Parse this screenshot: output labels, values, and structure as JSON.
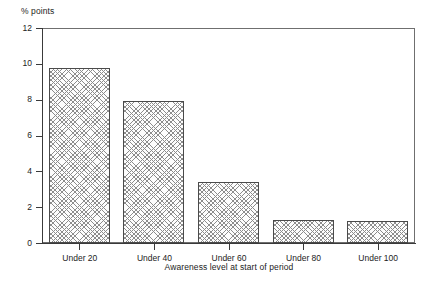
{
  "chart_data": {
    "type": "bar",
    "title": "",
    "subtitle": "",
    "categories": [
      "Under 20",
      "Under 40",
      "Under 60",
      "Under 80",
      "Under 100"
    ],
    "values": [
      9.75,
      7.95,
      3.4,
      1.28,
      1.22
    ],
    "series": [
      {
        "name": "% points",
        "values": [
          9.75,
          7.95,
          3.4,
          1.28,
          1.22
        ]
      }
    ],
    "xlabel": "Awareness level at start of period",
    "ylabel": "% points",
    "ylim": [
      0,
      12
    ],
    "yticks": [
      0,
      2,
      4,
      6,
      8,
      10,
      12
    ],
    "ytick_labels": [
      "0",
      "2",
      "4",
      "6",
      "8",
      "10",
      "12"
    ],
    "grid": false,
    "legend": false,
    "legend_position": "none",
    "bar_fill": "crosshatch-pattern",
    "bar_edge_color": "#4a4a4a",
    "frame": true,
    "annotations": []
  },
  "axes": {
    "y_unit_caption": "% points",
    "x_title": "Awareness level at start of period"
  }
}
